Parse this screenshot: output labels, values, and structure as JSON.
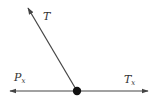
{
  "diagram": {
    "type": "force-diagram",
    "colors": {
      "line": "#444444",
      "dot": "#111111",
      "text": "#333333",
      "background": "#ffffff"
    },
    "point": {
      "x": 77,
      "y": 91,
      "r": 4.2
    },
    "vectors": [
      {
        "name": "T",
        "label": "T",
        "subscript": "",
        "from": [
          77,
          91
        ],
        "to": [
          28,
          8
        ],
        "label_pos": [
          43,
          20
        ]
      },
      {
        "name": "P_x",
        "label": "P",
        "subscript": "x",
        "from": [
          77,
          91
        ],
        "to": [
          10,
          91
        ],
        "label_pos": [
          14,
          81
        ]
      },
      {
        "name": "T_x",
        "label": "T",
        "subscript": "x",
        "from": [
          77,
          91
        ],
        "to": [
          148,
          91
        ],
        "label_pos": [
          124,
          83
        ]
      }
    ]
  }
}
